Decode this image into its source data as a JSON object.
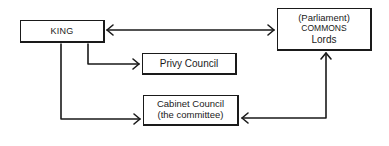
{
  "diagram": {
    "nodes": {
      "king": {
        "label": "KING"
      },
      "parliament": {
        "line1": "(Parliament)",
        "line2": "COMMONS",
        "line3": "Lords"
      },
      "privy_council": {
        "label": "Privy Council"
      },
      "cabinet_council": {
        "line1": "Cabinet Council",
        "line2": "(the committee)"
      }
    },
    "edges": [
      {
        "from": "king",
        "to": "parliament",
        "type": "bidirectional"
      },
      {
        "from": "king",
        "to": "privy_council",
        "type": "directed"
      },
      {
        "from": "king",
        "to": "cabinet_council",
        "type": "directed"
      },
      {
        "from": "cabinet_council",
        "to": "parliament",
        "type": "bidirectional"
      }
    ]
  }
}
